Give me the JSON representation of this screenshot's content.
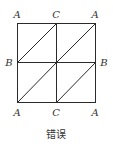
{
  "figure": {
    "caption": "错误",
    "labels": {
      "top_left": "A",
      "top_mid": "C",
      "top_right": "A",
      "mid_left": "B",
      "mid_right": "B",
      "bottom_left": "A",
      "bottom_mid": "C",
      "bottom_right": "A"
    },
    "grid": {
      "rows": 2,
      "cols": 2,
      "diagonals": "each cell: bottom-left to top-right"
    },
    "colors": {
      "line": "#2a2a2a",
      "text": "#333333",
      "background": "#ffffff"
    }
  }
}
